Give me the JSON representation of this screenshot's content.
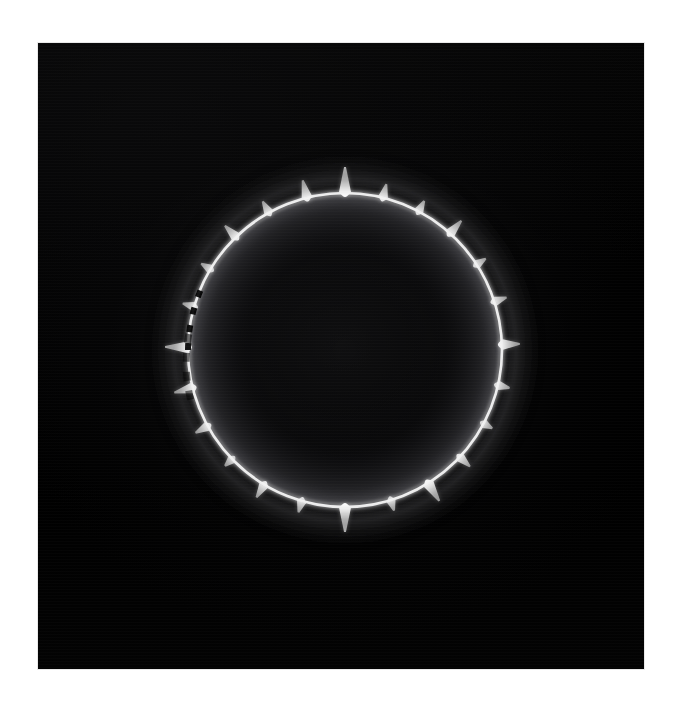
{
  "image": {
    "kind": "scientific-photograph",
    "subject": "bright annular ring with radial spikes",
    "border_color": "#ffffff",
    "plate_color": "#000000",
    "ring_color": "#ffffff",
    "halo_color": "#2a2a2c",
    "caption": ""
  },
  "chart_data": {
    "type": "scatter",
    "xlabel": "",
    "ylabel": "",
    "grid": false,
    "legend": "none",
    "xlim": [
      0,
      606
    ],
    "ylim": [
      0,
      626
    ],
    "geometry": {
      "center_x": 307,
      "center_y": 307,
      "ring_radius": 157,
      "ring_thickness": 3.2,
      "inner_halo_radius": 150,
      "outer_halo_radius": 178,
      "spike_count": 24
    },
    "categories": [
      "spike-00",
      "spike-01",
      "spike-02",
      "spike-03",
      "spike-04",
      "spike-05",
      "spike-06",
      "spike-07",
      "spike-08",
      "spike-09",
      "spike-10",
      "spike-11",
      "spike-12",
      "spike-13",
      "spike-14",
      "spike-15",
      "spike-16",
      "spike-17",
      "spike-18",
      "spike-19",
      "spike-20",
      "spike-21",
      "spike-22",
      "spike-23"
    ],
    "series": [
      {
        "name": "spike angle (deg, 0 = up, clockwise)",
        "values": [
          0,
          14,
          28,
          42,
          57,
          72,
          88,
          103,
          118,
          133,
          148,
          163,
          180,
          196,
          211,
          226,
          241,
          256,
          271,
          286,
          301,
          316,
          331,
          346
        ]
      },
      {
        "name": "spike length (px)",
        "values": [
          26,
          14,
          12,
          17,
          11,
          13,
          18,
          12,
          10,
          14,
          21,
          11,
          25,
          12,
          15,
          10,
          14,
          19,
          23,
          12,
          11,
          16,
          13,
          18
        ]
      },
      {
        "name": "spike brightness (0-1)",
        "values": [
          1.0,
          0.88,
          0.82,
          0.9,
          0.78,
          0.84,
          0.92,
          0.8,
          0.74,
          0.86,
          0.96,
          0.76,
          1.0,
          0.8,
          0.87,
          0.72,
          0.84,
          0.9,
          0.98,
          0.79,
          0.75,
          0.88,
          0.82,
          0.91
        ]
      },
      {
        "name": "ring arc brightness by octant (0-1)",
        "values": [
          0.95,
          0.92,
          0.88,
          0.9,
          0.86,
          0.8,
          0.62,
          0.7,
          0.95,
          0.92,
          0.88,
          0.9,
          0.86,
          0.8,
          0.62,
          0.7,
          0.95,
          0.92,
          0.88,
          0.9,
          0.86,
          0.8,
          0.62,
          0.7
        ]
      }
    ],
    "annotations": [
      "ring is continuous and brightest across the upper and right arcs",
      "ring is broken into dashes along the left arc (approx. 200-260 deg)",
      "a diffuse halo glows just inside and just outside the ring",
      "the disc interior is uniformly dark"
    ]
  }
}
